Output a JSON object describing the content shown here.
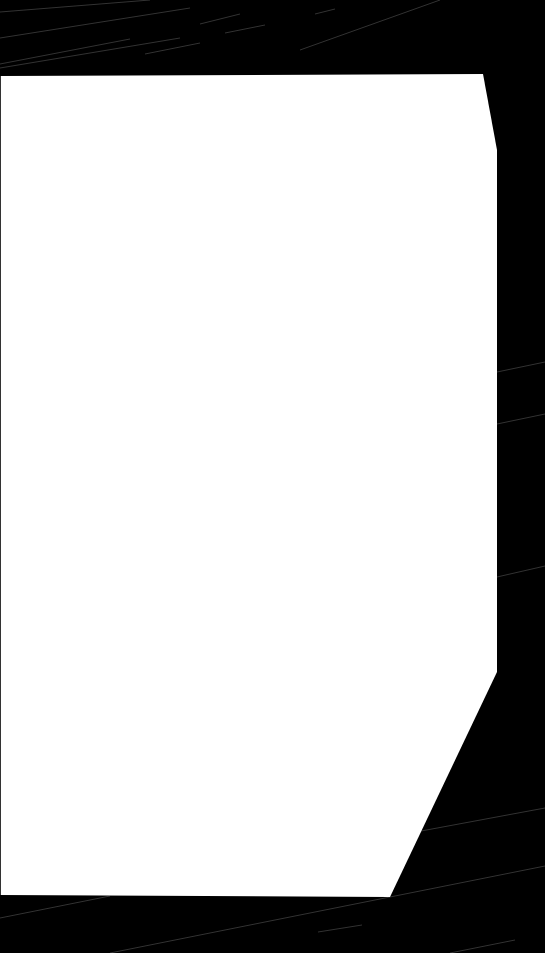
{
  "scene": {
    "description": "White polygonal sheet on black background with faint diagonal streaks",
    "background_color": "#000000",
    "sheet_color": "#ffffff",
    "streak_color": "#5a5a5a"
  }
}
